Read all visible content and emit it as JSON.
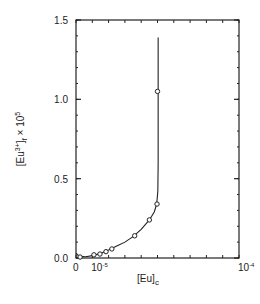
{
  "chart_data": {
    "type": "line",
    "title": "",
    "xlabel": "[Eu]c",
    "ylabel": "[Eu3+]f x 10^5",
    "xlabel_parts": {
      "main": "[Eu]",
      "sub": "c"
    },
    "ylabel_parts": {
      "main": "[Eu",
      "sup": "3+",
      "close": "]",
      "sub": "f",
      "suffix": " × 10",
      "exp": "5"
    },
    "xlim": [
      0,
      0.0001
    ],
    "ylim": [
      0,
      1.5
    ],
    "grid": false,
    "legend": null,
    "x_ticks": [
      {
        "value": 0,
        "label": "0",
        "exp": ""
      },
      {
        "value": 1e-05,
        "label": "10",
        "exp": "-5"
      },
      {
        "value": 0.0001,
        "label": "10",
        "exp": "-4"
      }
    ],
    "y_ticks": [
      {
        "value": 0.0,
        "label": "0.0"
      },
      {
        "value": 0.5,
        "label": "0.5"
      },
      {
        "value": 1.0,
        "label": "1.0"
      },
      {
        "value": 1.5,
        "label": "1.5"
      }
    ],
    "x_minor_step": 1e-05,
    "y_minor_step": 0.1,
    "series": [
      {
        "name": "measured",
        "marker": "open-circle",
        "x": [
          2.5e-06,
          1.1e-05,
          1.47e-05,
          1.84e-05,
          2.2e-05,
          3.6e-05,
          4.5e-05,
          4.97e-05,
          5e-05
        ],
        "y": [
          0.006,
          0.02,
          0.025,
          0.04,
          0.057,
          0.14,
          0.24,
          0.34,
          1.05
        ]
      },
      {
        "name": "fit-curve",
        "marker": "none",
        "x": [
          0,
          2e-06,
          6e-06,
          1e-05,
          1.5e-05,
          2e-05,
          2.5e-05,
          3e-05,
          3.5e-05,
          4e-05,
          4.5e-05,
          4.8e-05,
          4.95e-05,
          5.02e-05,
          5.04e-05,
          5.04e-05
        ],
        "y": [
          0.03,
          0.01,
          0.008,
          0.015,
          0.028,
          0.05,
          0.075,
          0.1,
          0.135,
          0.18,
          0.24,
          0.29,
          0.34,
          0.42,
          0.6,
          1.39
        ]
      }
    ],
    "annotations": []
  }
}
